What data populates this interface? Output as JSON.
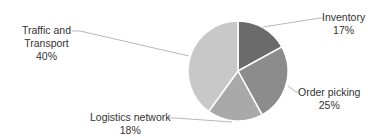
{
  "chart_data": {
    "type": "pie",
    "title": "",
    "slices": [
      {
        "label": "Inventory",
        "value": 17,
        "display": "17%",
        "color": "#6b6b6b"
      },
      {
        "label": "Order picking",
        "value": 25,
        "display": "25%",
        "color": "#8c8c8c"
      },
      {
        "label": "Logistics network",
        "value": 18,
        "display": "18%",
        "color": "#a9a9a9"
      },
      {
        "label": "Traffic and Transport",
        "value": 40,
        "display": "40%",
        "color": "#c8c8c8"
      }
    ],
    "start_angle_deg": 0,
    "direction": "clockwise",
    "legend": "none",
    "data_labels": "outside with leader lines"
  },
  "labels": {
    "inventory": {
      "name": "Inventory",
      "pct": "17%"
    },
    "order_picking": {
      "name": "Order picking",
      "pct": "25%"
    },
    "logistics": {
      "name": "Logistics network",
      "pct": "18%"
    },
    "traffic_l1": "Traffic and",
    "traffic_l2": "Transport",
    "traffic_pct": "40%"
  }
}
